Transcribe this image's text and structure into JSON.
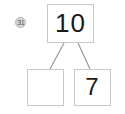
{
  "diagram": {
    "type": "number-bond",
    "whole": {
      "label": "10",
      "filled": true
    },
    "parts": [
      {
        "position": "left",
        "label": "",
        "filled": false
      },
      {
        "position": "right",
        "label": "7",
        "filled": true
      }
    ],
    "connectors": [
      {
        "from": "whole",
        "to": "part-left"
      },
      {
        "from": "whole",
        "to": "part-right"
      }
    ],
    "marker": {
      "label": "31",
      "icon": "circle-badge-icon"
    },
    "colors": {
      "box_border": "#c9c9c9",
      "connector_line": "#9a9a9a",
      "text": "#1a1a1a",
      "background": "#ffffff",
      "marker_fill": "#d6d6d6"
    }
  }
}
